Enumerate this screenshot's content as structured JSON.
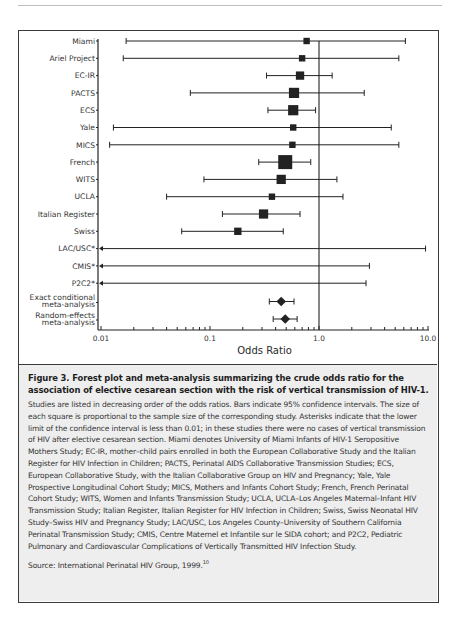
{
  "chart_data": {
    "type": "forest",
    "title": "Figure 3. Forest plot and meta-analysis summarizing the crude odds ratio for the association of elective cesarean section with the risk of vertical transmission of HIV-1.",
    "xlabel": "Odds Ratio",
    "ylabel": "",
    "xscale": "log",
    "xlim": [
      0.01,
      10.0
    ],
    "xticks": [
      "0.01",
      "0.1",
      "1.0",
      "10.0"
    ],
    "reference_line": 1.0,
    "grid": false,
    "studies": [
      {
        "label": "Miami",
        "or": 0.77,
        "lower": 0.017,
        "upper": 6.2,
        "size": 2,
        "marker": "square"
      },
      {
        "label": "Ariel Project",
        "or": 0.7,
        "lower": 0.016,
        "upper": 5.4,
        "size": 2,
        "marker": "square"
      },
      {
        "label": "EC-IR",
        "or": 0.67,
        "lower": 0.33,
        "upper": 1.32,
        "size": 3,
        "marker": "square"
      },
      {
        "label": "PACTS",
        "or": 0.59,
        "lower": 0.066,
        "upper": 2.6,
        "size": 4,
        "marker": "square"
      },
      {
        "label": "ECS",
        "or": 0.58,
        "lower": 0.34,
        "upper": 0.93,
        "size": 4,
        "marker": "square"
      },
      {
        "label": "Yale",
        "or": 0.58,
        "lower": 0.013,
        "upper": 4.6,
        "size": 2,
        "marker": "square"
      },
      {
        "label": "MICS",
        "or": 0.57,
        "lower": 0.012,
        "upper": 5.4,
        "size": 2,
        "marker": "square"
      },
      {
        "label": "French",
        "or": 0.49,
        "lower": 0.28,
        "upper": 0.84,
        "size": 6,
        "marker": "square"
      },
      {
        "label": "WITS",
        "or": 0.45,
        "lower": 0.088,
        "upper": 1.46,
        "size": 3.5,
        "marker": "square"
      },
      {
        "label": "UCLA",
        "or": 0.37,
        "lower": 0.04,
        "upper": 1.66,
        "size": 2,
        "marker": "square"
      },
      {
        "label": "Italian Register",
        "or": 0.31,
        "lower": 0.13,
        "upper": 0.67,
        "size": 3.5,
        "marker": "square"
      },
      {
        "label": "Swiss",
        "or": 0.18,
        "lower": 0.055,
        "upper": 0.47,
        "size": 2.5,
        "marker": "square"
      },
      {
        "label": "LAC/USC*",
        "or": null,
        "lower": "<0.01",
        "upper": 9.5,
        "size": 0,
        "marker": "none"
      },
      {
        "label": "CMIS*",
        "or": null,
        "lower": "<0.01",
        "upper": 2.9,
        "size": 0,
        "marker": "none"
      },
      {
        "label": "P2C2*",
        "or": null,
        "lower": "<0.01",
        "upper": 2.7,
        "size": 0,
        "marker": "none"
      }
    ],
    "meta_analyses": [
      {
        "label_lines": [
          "Exact conditional",
          "meta-analysis"
        ],
        "or": 0.45,
        "lower": 0.35,
        "upper": 0.59,
        "marker": "diamond"
      },
      {
        "label_lines": [
          "Random-effects",
          "meta-analysis"
        ],
        "or": 0.49,
        "lower": 0.38,
        "upper": 0.63,
        "marker": "diamond"
      }
    ]
  },
  "caption": {
    "title": "Figure 3. Forest plot and meta-analysis summarizing the crude odds ratio for the association of elective cesarean section with the risk of vertical transmission of HIV-1.",
    "body": "Studies are listed in decreasing order of the odds ratios. Bars indicate 95% confidence intervals. The size of each square is proportional to the sample size of the corresponding study. Asterisks indicate that the lower limit of the confidence interval is less than 0.01; in these studies there were no cases of vertical transmission of HIV after elective cesarean section. Miami denotes University of Miami Infants of HIV-1 Seropositive Mothers Study; EC-IR, mother–child pairs enrolled in both the European Collaborative Study and the Italian Register for HIV Infection in Children; PACTS, Perinatal AIDS Collaborative Transmission Studies; ECS, European Collaborative Study, with the Italian Collaborative Group on HIV and Pregnancy; Yale, Yale Prospective Longitudinal Cohort Study; MICS, Mothers and Infants Cohort Study; French, French Perinatal Cohort Study; WITS, Women and Infants Transmission Study; UCLA, UCLA–Los Angeles Maternal–Infant HIV Transmission Study; Italian Register, Italian Register for HIV Infection in Children; Swiss, Swiss Neonatal HIV Study–Swiss HIV and Pregnancy Study; LAC/USC, Los Angeles County–University of Southern California Perinatal Transmission Study; CMIS, Centre Maternel et Infantile sur le SIDA cohort; and P2C2, Pediatric Pulmonary and Cardiovascular Complications of Vertically Transmitted HIV Infection Study.",
    "source": "Source: International Perinatal HIV Group, 1999.",
    "source_ref": "10"
  },
  "colors": {
    "ink": "#222222",
    "frame": "#3a3a3a",
    "caption_bg": "#eeeeee",
    "label": "#333333"
  }
}
